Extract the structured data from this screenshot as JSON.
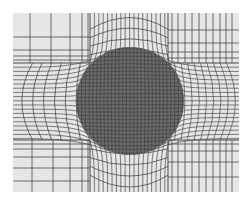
{
  "diagram": {
    "type": "finite-element-mesh",
    "colors": {
      "page_background": "#ffffff",
      "matrix_fill": "#e6e6e6",
      "matrix_line": "#4a4a4a",
      "inclusion_fill": "#6b6b6b",
      "inclusion_line": "#3a3a3a"
    },
    "domain": {
      "x0": 13,
      "y0": 13,
      "x1": 239,
      "y1": 192
    },
    "bands": {
      "left_x": 90,
      "right_x": 168,
      "top_y": 63,
      "bottom_y": 140
    },
    "inclusion": {
      "cx": 130,
      "cy": 101,
      "r": 54,
      "grid_spacing": 3.6
    },
    "corner_blocks": {
      "top_left": {
        "v_lines": [
          30,
          51,
          70,
          82,
          88
        ],
        "h_lines": [
          37,
          50,
          56,
          60
        ]
      },
      "top_right": {
        "v_lines": [
          172,
          178,
          185,
          192,
          199,
          206,
          213,
          220,
          226,
          232
        ],
        "h_lines": [
          30,
          43,
          52,
          58
        ]
      },
      "bottom_left": {
        "v_lines": [
          32,
          53,
          70,
          82,
          88
        ],
        "h_lines": [
          144,
          149,
          157,
          168,
          181
        ]
      },
      "bottom_right": {
        "v_lines": [
          172,
          178,
          185,
          192,
          199,
          206,
          213,
          220,
          226,
          232
        ],
        "h_lines": [
          144,
          151,
          162,
          177
        ]
      }
    },
    "side_bands": {
      "left_arcs": 6,
      "right_arcs": 9,
      "left_h_spacing": 4.2,
      "right_h_spacing": 4.2
    },
    "top_bottom_bands": {
      "top_v_spacing": 4.4,
      "bottom_v_spacing": 4.4,
      "top_arcs": 4,
      "bottom_arcs": 4
    }
  }
}
